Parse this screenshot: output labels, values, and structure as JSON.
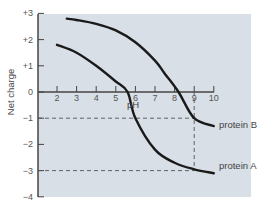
{
  "chart_data": {
    "type": "line",
    "title": "",
    "xlabel": "pH",
    "ylabel": "Net charge",
    "xlim": [
      1,
      11
    ],
    "ylim": [
      -4,
      3
    ],
    "x_ticks": [
      "2",
      "3",
      "4",
      "5",
      "6",
      "7",
      "8",
      "9",
      "10"
    ],
    "y_ticks": [
      "+3",
      "+2",
      "+1",
      "0",
      "−1",
      "−2",
      "−3",
      "−4"
    ],
    "grid": false,
    "series": [
      {
        "name": "protein A",
        "x": [
          2.0,
          3.0,
          4.0,
          5.0,
          5.6,
          6.0,
          7.0,
          8.0,
          9.0,
          10.0
        ],
        "values": [
          1.8,
          1.5,
          1.0,
          0.4,
          0.0,
          -1.0,
          -2.2,
          -2.7,
          -2.95,
          -3.1
        ]
      },
      {
        "name": "protein B",
        "x": [
          2.5,
          3.0,
          4.0,
          5.0,
          6.0,
          7.0,
          7.5,
          8.2,
          9.0,
          10.0
        ],
        "values": [
          2.8,
          2.75,
          2.6,
          2.35,
          1.9,
          1.2,
          0.7,
          0.0,
          -1.0,
          -1.3
        ]
      }
    ],
    "annotations": [
      {
        "type": "hline-dashed",
        "y": -1,
        "x_to": 9.0
      },
      {
        "type": "hline-dashed",
        "y": -3,
        "x_to": 9.0
      },
      {
        "type": "vline-dashed",
        "x": 9.0,
        "y_from": 0,
        "y_to": -3
      }
    ],
    "legend": "inline labels at right end of curves",
    "colors": {
      "background": "#d8dfe6",
      "line": "#1a1a1a",
      "axis": "#444444",
      "dash": "#555555"
    }
  }
}
